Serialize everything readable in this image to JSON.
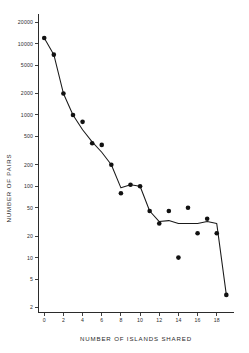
{
  "chart_data": {
    "type": "scatter",
    "title": "",
    "xlabel": "NUMBER OF ISLANDS SHARED",
    "ylabel": "NUMBER OF PAIRS",
    "yscale": "log",
    "xscale": "linear",
    "xlim": [
      -0.6,
      19.8
    ],
    "ylim": [
      1.7,
      26000
    ],
    "grid": false,
    "legend": false,
    "xticks": [
      0,
      2,
      4,
      6,
      8,
      10,
      12,
      14,
      16,
      18
    ],
    "xtick_labels": [
      "0",
      "2",
      "4",
      "6",
      "8",
      "10",
      "12",
      "14",
      "16",
      "18"
    ],
    "yticks": [
      2,
      5,
      10,
      20,
      50,
      100,
      200,
      500,
      1000,
      2000,
      5000,
      10000,
      20000
    ],
    "ytick_labels": [
      "2",
      "5",
      "10",
      "20",
      "50",
      "100",
      "200",
      "500",
      "1000",
      "2000",
      "5000",
      "10000",
      "20000"
    ],
    "x": [
      0,
      1,
      2,
      3,
      4,
      5,
      6,
      7,
      8,
      9,
      10,
      11,
      12,
      13,
      14,
      15,
      16,
      17,
      18,
      19
    ],
    "values": [
      12000,
      7000,
      2000,
      1000,
      800,
      400,
      380,
      200,
      80,
      105,
      100,
      45,
      30,
      45,
      10,
      50,
      22,
      35,
      22,
      3
    ],
    "line_values": [
      12000,
      7000,
      2000,
      1000,
      620,
      420,
      300,
      200,
      95,
      105,
      100,
      45,
      32,
      33,
      30,
      30,
      30,
      32,
      30,
      3
    ],
    "series": [
      {
        "name": "pairs",
        "marker": "filled-circle",
        "connected": true,
        "values": [
          12000,
          7000,
          2000,
          1000,
          800,
          400,
          380,
          200,
          80,
          105,
          100,
          45,
          30,
          45,
          10,
          50,
          22,
          35,
          22,
          3
        ]
      }
    ]
  },
  "axes": {
    "x_title": "NUMBER OF ISLANDS SHARED",
    "y_title": "NUMBER OF PAIRS"
  }
}
